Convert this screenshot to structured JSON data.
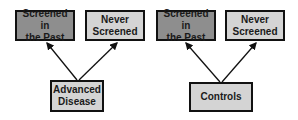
{
  "diagram": {
    "left_group": {
      "top_left": {
        "label": "Screened in\nthe Past",
        "fill": "#8e8e8e"
      },
      "top_right": {
        "label": "Never\nScreened",
        "fill": "#d4d4d4"
      },
      "bottom": {
        "label": "Advanced\nDisease",
        "fill": "#d4d4d4"
      }
    },
    "right_group": {
      "top_left": {
        "label": "Screened in\nthe Past",
        "fill": "#8e8e8e"
      },
      "top_right": {
        "label": "Never\nScreened",
        "fill": "#d4d4d4"
      },
      "bottom": {
        "label": "Controls",
        "fill": "#d4d4d4"
      }
    },
    "edges": [
      {
        "from": "Advanced Disease",
        "to": "Screened in the Past"
      },
      {
        "from": "Advanced Disease",
        "to": "Never Screened"
      },
      {
        "from": "Controls",
        "to": "Screened in the Past"
      },
      {
        "from": "Controls",
        "to": "Never Screened"
      }
    ]
  }
}
